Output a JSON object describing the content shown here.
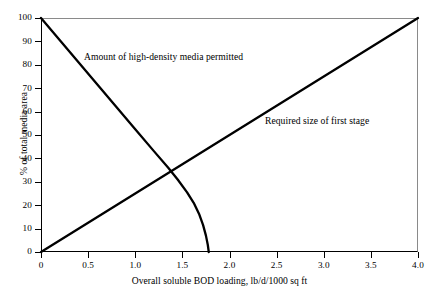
{
  "chart_data": {
    "type": "line",
    "title": "",
    "xlabel": "Overall soluble BOD loading, lb/d/1000 sq ft",
    "ylabel": "% of total media area",
    "xlim": [
      0,
      4.0
    ],
    "ylim": [
      0,
      100
    ],
    "grid": false,
    "legend_position": "inline-annotations",
    "xticks": [
      "0",
      "0.5",
      "1.0",
      "1.5",
      "2.0",
      "2.5",
      "3.0",
      "3.5",
      "4.0"
    ],
    "xtick_values": [
      0,
      0.5,
      1.0,
      1.5,
      2.0,
      2.5,
      3.0,
      3.5,
      4.0
    ],
    "yticks": [
      "0",
      "10",
      "20",
      "30",
      "40",
      "50",
      "60",
      "70",
      "80",
      "90",
      "100"
    ],
    "ytick_values": [
      0,
      10,
      20,
      30,
      40,
      50,
      60,
      70,
      80,
      90,
      100
    ],
    "line_color": "#000000",
    "background_color": "#ffffff",
    "series": [
      {
        "name": "Amount of high-density media permitted",
        "annotation": "Amount of high-density media permitted",
        "shape": "straight line then steep knee to zero",
        "x": [
          0.0,
          0.2,
          0.4,
          0.6,
          0.8,
          1.0,
          1.2,
          1.35,
          1.45,
          1.55,
          1.62,
          1.68,
          1.72,
          1.75,
          1.77,
          1.78
        ],
        "values": [
          100.0,
          90.5,
          81.0,
          71.5,
          62.0,
          52.5,
          43.0,
          36.0,
          31.0,
          25.5,
          21.0,
          16.0,
          11.5,
          7.0,
          3.0,
          0.0
        ]
      },
      {
        "name": "Required size of first stage",
        "annotation": "Required size of first stage",
        "shape": "straight line",
        "x": [
          0.0,
          4.0
        ],
        "values": [
          0,
          100
        ]
      }
    ],
    "annotations": [
      {
        "text": "Amount of high-density media permitted",
        "x": 0.46,
        "y": 84
      },
      {
        "text": "Required size of first stage",
        "x": 2.38,
        "y": 57
      }
    ],
    "intersection": {
      "x": 1.5,
      "y": 37
    }
  }
}
